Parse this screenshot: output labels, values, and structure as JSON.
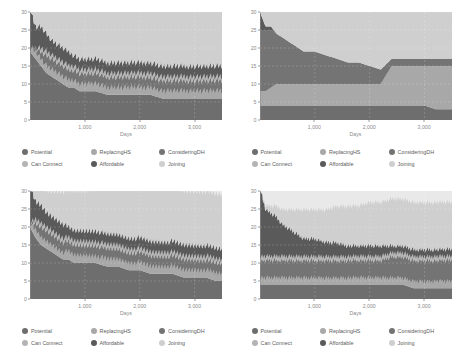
{
  "figure": {
    "panel_count": 4,
    "legend_labels": [
      "Potential",
      "ReplacingHS",
      "ConsideringDH",
      "Can Connect",
      "Affordable",
      "Joining"
    ],
    "legend_colors": [
      "#6e6e6e",
      "#a8a8a8",
      "#747474",
      "#b4b4b4",
      "#5a5a5a",
      "#cfcfcf"
    ],
    "axis_label_color": "#8a8a8a",
    "plot_bg": "#e9e9e9"
  },
  "chart_data": [
    {
      "type": "area",
      "id": "panel-top-left",
      "title": "",
      "xlabel": "Days",
      "ylabel": "Number of agents",
      "xlim": [
        0,
        3500
      ],
      "ylim": [
        0,
        30
      ],
      "xticks": [
        1000,
        2000,
        3000
      ],
      "xticklabels": [
        "1,000",
        "2,000",
        "3,000"
      ],
      "yticks": [
        0,
        5,
        10,
        15,
        20,
        25,
        30
      ],
      "yticklabels": [
        "0",
        "5",
        "10",
        "15",
        "20",
        "25",
        "30"
      ],
      "grid": true,
      "legend_position": "below",
      "stacked": true,
      "x": [
        0,
        100,
        200,
        300,
        400,
        500,
        600,
        700,
        800,
        900,
        1000,
        1200,
        1400,
        1600,
        1800,
        2000,
        2200,
        2400,
        2600,
        2800,
        3000,
        3200,
        3400,
        3500
      ],
      "series": [
        {
          "name": "Potential",
          "color": "#6e6e6e",
          "values": [
            19,
            17,
            15,
            13,
            12,
            11,
            10,
            9,
            9,
            8,
            8,
            8,
            7,
            7,
            7,
            7,
            7,
            6,
            6,
            6,
            6,
            6,
            6,
            6
          ]
        },
        {
          "name": "ReplacingHS",
          "color": "#a8a8a8",
          "values": [
            0,
            1,
            1,
            1,
            1,
            1,
            1,
            1,
            1,
            1,
            1,
            1,
            1,
            1,
            1,
            1,
            1,
            1,
            1,
            1,
            1,
            1,
            1,
            1
          ]
        },
        {
          "name": "ConsideringDH",
          "color": "#747474",
          "values": [
            0,
            1,
            2,
            3,
            3,
            3,
            3,
            3,
            3,
            3,
            3,
            3,
            3,
            3,
            3,
            3,
            3,
            3,
            3,
            3,
            3,
            3,
            3,
            3
          ]
        },
        {
          "name": "Can Connect",
          "color": "#b4b4b4",
          "values": [
            0,
            0,
            1,
            1,
            1,
            1,
            1,
            1,
            1,
            1,
            1,
            1,
            1,
            1,
            1,
            1,
            1,
            1,
            1,
            1,
            1,
            1,
            1,
            1
          ]
        },
        {
          "name": "Affordable",
          "color": "#5a5a5a",
          "values": [
            11,
            6,
            6,
            5,
            4,
            4,
            4,
            4,
            3,
            3,
            3,
            3,
            3,
            3,
            3,
            3,
            3,
            3,
            3,
            3,
            3,
            3,
            3,
            3
          ]
        },
        {
          "name": "Joining",
          "color": "#cfcfcf",
          "values": [
            0,
            5,
            5,
            7,
            9,
            10,
            11,
            12,
            13,
            14,
            14,
            14,
            15,
            15,
            15,
            15,
            15,
            16,
            16,
            16,
            16,
            16,
            16,
            16
          ]
        }
      ],
      "boundary_top": [
        30,
        25,
        25,
        24,
        22,
        20,
        20,
        19,
        18,
        18,
        18,
        18,
        17,
        17,
        17,
        16,
        16,
        15,
        15,
        15,
        15,
        15,
        15,
        15
      ],
      "oscillation": {
        "present": true,
        "band": "ReplacingHS",
        "amplitude": 2.0,
        "period": 60
      }
    },
    {
      "type": "area",
      "id": "panel-top-right",
      "title": "",
      "xlabel": "Days",
      "ylabel": "Number of agents",
      "xlim": [
        0,
        3500
      ],
      "ylim": [
        0,
        30
      ],
      "xticks": [
        1000,
        2000,
        3000
      ],
      "xticklabels": [
        "1,000",
        "2,000",
        "3,000"
      ],
      "yticks": [
        0,
        5,
        10,
        15,
        20,
        25,
        30
      ],
      "yticklabels": [
        "0",
        "5",
        "10",
        "15",
        "20",
        "25",
        "30"
      ],
      "grid": true,
      "legend_position": "below",
      "stacked": true,
      "x": [
        0,
        100,
        200,
        300,
        400,
        500,
        600,
        700,
        800,
        900,
        1000,
        1200,
        1400,
        1600,
        1800,
        2000,
        2200,
        2400,
        2600,
        2800,
        3000,
        3200,
        3400,
        3500
      ],
      "series": [
        {
          "name": "Potential",
          "color": "#6e6e6e",
          "values": [
            4,
            4,
            4,
            4,
            4,
            4,
            4,
            4,
            4,
            4,
            4,
            4,
            4,
            4,
            4,
            4,
            4,
            4,
            4,
            4,
            4,
            3,
            3,
            3
          ]
        },
        {
          "name": "ReplacingHS",
          "color": "#a8a8a8",
          "values": [
            4,
            4,
            5,
            6,
            6,
            6,
            6,
            6,
            6,
            6,
            6,
            6,
            6,
            6,
            6,
            6,
            6,
            11,
            11,
            11,
            11,
            12,
            12,
            12
          ]
        },
        {
          "name": "ConsideringDH",
          "color": "#747474",
          "values": [
            17,
            17,
            16,
            14,
            13,
            12,
            11,
            10,
            9,
            9,
            9,
            8,
            7,
            6,
            6,
            5,
            4,
            2,
            2,
            2,
            2,
            2,
            2,
            2
          ]
        },
        {
          "name": "Can Connect",
          "color": "#b4b4b4",
          "values": [
            0,
            0,
            0,
            0,
            0,
            0,
            0,
            0,
            0,
            0,
            0,
            0,
            0,
            0,
            0,
            0,
            0,
            0,
            0,
            0,
            0,
            0,
            0,
            0
          ]
        },
        {
          "name": "Affordable",
          "color": "#5a5a5a",
          "values": [
            5,
            1,
            1,
            0,
            0,
            0,
            0,
            0,
            0,
            0,
            0,
            0,
            0,
            0,
            0,
            0,
            0,
            0,
            0,
            0,
            0,
            0,
            0,
            0
          ]
        },
        {
          "name": "Joining",
          "color": "#cfcfcf",
          "values": [
            0,
            4,
            4,
            6,
            7,
            8,
            9,
            10,
            11,
            11,
            11,
            12,
            13,
            14,
            14,
            15,
            16,
            13,
            13,
            13,
            13,
            13,
            13,
            13
          ]
        }
      ],
      "boundary_top": [
        30,
        26,
        26,
        24,
        23,
        22,
        21,
        20,
        19,
        19,
        19,
        18,
        17,
        16,
        16,
        15,
        14,
        17,
        17,
        17,
        17,
        17,
        17,
        17
      ],
      "oscillation": {
        "present": false
      }
    },
    {
      "type": "area",
      "id": "panel-bottom-left",
      "title": "",
      "xlabel": "Days",
      "ylabel": "Number of agents",
      "xlim": [
        0,
        3500
      ],
      "ylim": [
        0,
        30
      ],
      "xticks": [
        1000,
        2000,
        3000
      ],
      "xticklabels": [
        "1,000",
        "2,000",
        "3,000"
      ],
      "yticks": [
        0,
        5,
        10,
        15,
        20,
        25,
        30
      ],
      "yticklabels": [
        "0",
        "5",
        "10",
        "15",
        "20",
        "25",
        "30"
      ],
      "grid": true,
      "legend_position": "below",
      "stacked": true,
      "x": [
        0,
        100,
        200,
        300,
        400,
        500,
        600,
        700,
        800,
        900,
        1000,
        1200,
        1400,
        1600,
        1800,
        2000,
        2200,
        2400,
        2600,
        2800,
        3000,
        3200,
        3400,
        3500
      ],
      "series": [
        {
          "name": "Potential",
          "color": "#6e6e6e",
          "values": [
            20,
            17,
            15,
            14,
            13,
            12,
            11,
            11,
            10,
            10,
            10,
            10,
            9,
            9,
            8,
            8,
            7,
            7,
            7,
            6,
            6,
            6,
            5,
            5
          ]
        },
        {
          "name": "ReplacingHS",
          "color": "#a8a8a8",
          "values": [
            0,
            1,
            1,
            1,
            1,
            1,
            1,
            1,
            1,
            1,
            1,
            1,
            1,
            1,
            1,
            1,
            1,
            1,
            1,
            1,
            1,
            1,
            1,
            1
          ]
        },
        {
          "name": "ConsideringDH",
          "color": "#747474",
          "values": [
            0,
            2,
            3,
            3,
            3,
            3,
            3,
            3,
            3,
            3,
            3,
            3,
            3,
            3,
            3,
            3,
            3,
            3,
            3,
            3,
            3,
            3,
            3,
            3
          ]
        },
        {
          "name": "Can Connect",
          "color": "#b4b4b4",
          "values": [
            0,
            1,
            1,
            1,
            1,
            1,
            1,
            1,
            1,
            1,
            1,
            1,
            1,
            1,
            1,
            1,
            1,
            1,
            1,
            1,
            1,
            1,
            1,
            1
          ]
        },
        {
          "name": "Affordable",
          "color": "#5a5a5a",
          "values": [
            10,
            5,
            5,
            4,
            4,
            4,
            4,
            3,
            3,
            3,
            3,
            3,
            3,
            3,
            3,
            3,
            3,
            3,
            3,
            3,
            3,
            3,
            3,
            3
          ]
        },
        {
          "name": "Joining",
          "color": "#cfcfcf",
          "values": [
            0,
            4,
            5,
            6,
            7,
            8,
            9,
            10,
            11,
            11,
            11,
            12,
            13,
            13,
            14,
            14,
            15,
            15,
            15,
            15,
            15,
            15,
            15,
            15
          ]
        }
      ],
      "boundary_top": [
        30,
        26,
        25,
        24,
        23,
        22,
        21,
        21,
        20,
        20,
        20,
        19,
        18,
        18,
        17,
        17,
        16,
        16,
        16,
        15,
        15,
        15,
        15,
        15
      ],
      "oscillation": {
        "present": true,
        "band": "ReplacingHS",
        "amplitude": 2.0,
        "period": 55
      }
    },
    {
      "type": "area",
      "id": "panel-bottom-right",
      "title": "",
      "xlabel": "Days",
      "ylabel": "Number of agents",
      "xlim": [
        0,
        3500
      ],
      "ylim": [
        0,
        30
      ],
      "xticks": [
        1000,
        2000,
        3000
      ],
      "xticklabels": [
        "1,000",
        "2,000",
        "3,000"
      ],
      "yticks": [
        0,
        5,
        10,
        15,
        20,
        25,
        30
      ],
      "yticklabels": [
        "0",
        "5",
        "10",
        "15",
        "20",
        "25",
        "30"
      ],
      "grid": true,
      "legend_position": "below",
      "stacked": true,
      "x": [
        0,
        100,
        200,
        300,
        400,
        500,
        600,
        700,
        800,
        900,
        1000,
        1200,
        1400,
        1600,
        1800,
        2000,
        2200,
        2400,
        2600,
        2800,
        3000,
        3200,
        3400,
        3500
      ],
      "series": [
        {
          "name": "Potential",
          "color": "#6e6e6e",
          "values": [
            4,
            4,
            4,
            4,
            4,
            4,
            4,
            4,
            4,
            4,
            4,
            4,
            4,
            4,
            4,
            4,
            4,
            4,
            4,
            3,
            3,
            3,
            3,
            3
          ]
        },
        {
          "name": "ReplacingHS",
          "color": "#a8a8a8",
          "values": [
            1,
            1,
            1,
            1,
            1,
            1,
            1,
            1,
            1,
            1,
            1,
            1,
            1,
            1,
            1,
            1,
            1,
            1,
            1,
            1,
            1,
            1,
            1,
            1
          ]
        },
        {
          "name": "ConsideringDH",
          "color": "#747474",
          "values": [
            5,
            5,
            5,
            5,
            5,
            5,
            5,
            5,
            5,
            5,
            5,
            5,
            5,
            5,
            5,
            5,
            5,
            6,
            6,
            6,
            6,
            6,
            6,
            6
          ]
        },
        {
          "name": "Can Connect",
          "color": "#b4b4b4",
          "values": [
            1,
            1,
            1,
            1,
            1,
            1,
            1,
            1,
            1,
            1,
            1,
            1,
            1,
            1,
            1,
            1,
            1,
            1,
            1,
            1,
            1,
            1,
            1,
            1
          ]
        },
        {
          "name": "Affordable",
          "color": "#5a5a5a",
          "values": [
            19,
            13,
            12,
            11,
            9,
            8,
            7,
            6,
            5,
            5,
            5,
            4,
            4,
            3,
            3,
            3,
            3,
            2,
            2,
            2,
            2,
            2,
            2,
            2
          ]
        },
        {
          "name": "Joining",
          "color": "#cfcfcf",
          "values": [
            0,
            1,
            2,
            3,
            4,
            5,
            6,
            7,
            8,
            8,
            8,
            9,
            10,
            11,
            11,
            12,
            12,
            13,
            13,
            13,
            13,
            13,
            13,
            13
          ]
        }
      ],
      "boundary_top": [
        30,
        25,
        25,
        24,
        22,
        21,
        20,
        19,
        18,
        18,
        18,
        17,
        16,
        15,
        15,
        15,
        15,
        14,
        14,
        14,
        14,
        14,
        14,
        14
      ],
      "oscillation": {
        "present": true,
        "band": "ReplacingHS",
        "amplitude": 1.6,
        "period": 45
      }
    }
  ]
}
